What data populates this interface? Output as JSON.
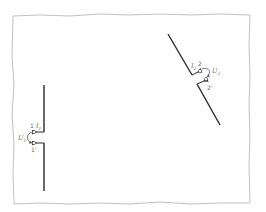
{
  "diagram": {
    "type": "two-port antenna system",
    "colors": {
      "frame": "#b0b0b0",
      "wire": "#2a2a2a",
      "label": "#6a6a6a",
      "background": "#ffffff"
    },
    "antenna_1": {
      "terminal_top": "1",
      "terminal_bottom": "1'",
      "current_label": "I",
      "current_sub": "1",
      "voltage_label": "U",
      "voltage_sub": "1"
    },
    "antenna_2": {
      "terminal_top": "2",
      "terminal_bottom": "2'",
      "current_label": "I",
      "current_sub": "2",
      "voltage_label": "U",
      "voltage_sub": "2"
    }
  }
}
